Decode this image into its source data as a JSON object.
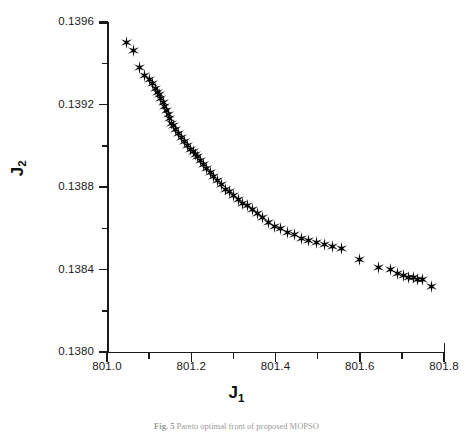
{
  "figure": {
    "caption_prefix": "Fig. 5",
    "caption_text": "Pareto optimal front of proposed MOPSO",
    "background_color": "#ffffff",
    "marker_color": "#080808",
    "axis_color": "#1a1a1a"
  },
  "chart_data": {
    "type": "scatter",
    "title": "",
    "xlabel": "J",
    "xlabel_sub": "1",
    "ylabel": "J",
    "ylabel_sub": "2",
    "xlim": [
      801.0,
      801.8
    ],
    "ylim": [
      0.138,
      0.1396
    ],
    "xticks": [
      801.0,
      801.2,
      801.4,
      801.6,
      801.8
    ],
    "xtick_labels": [
      "801.0",
      "801.2",
      "801.4",
      "801.6",
      "801.8"
    ],
    "x_minor_ticks": [
      801.1,
      801.3,
      801.5,
      801.7
    ],
    "yticks": [
      0.138,
      0.1384,
      0.1388,
      0.1392,
      0.1396
    ],
    "ytick_labels": [
      "0.1380",
      "0.1384",
      "0.1388",
      "0.1392",
      "0.1396"
    ],
    "y_minor_ticks": [
      0.1382,
      0.1386,
      0.139,
      0.1394
    ],
    "grid": false,
    "legend": false,
    "marker": "star6",
    "n_points": 62,
    "series": [
      {
        "name": "Pareto optimal front",
        "points": [
          [
            801.047,
            0.1395
          ],
          [
            801.063,
            0.13946
          ],
          [
            801.078,
            0.13938
          ],
          [
            801.09,
            0.13934
          ],
          [
            801.101,
            0.13932
          ],
          [
            801.108,
            0.1393
          ],
          [
            801.114,
            0.13928
          ],
          [
            801.119,
            0.13926
          ],
          [
            801.124,
            0.13925
          ],
          [
            801.128,
            0.13923
          ],
          [
            801.133,
            0.13921
          ],
          [
            801.137,
            0.13919
          ],
          [
            801.141,
            0.13917
          ],
          [
            801.145,
            0.13915
          ],
          [
            801.148,
            0.13913
          ],
          [
            801.152,
            0.13911
          ],
          [
            801.157,
            0.1391
          ],
          [
            801.163,
            0.13908
          ],
          [
            801.17,
            0.13906
          ],
          [
            801.177,
            0.13904
          ],
          [
            801.185,
            0.13902
          ],
          [
            801.192,
            0.139
          ],
          [
            801.199,
            0.13898
          ],
          [
            801.205,
            0.13897
          ],
          [
            801.211,
            0.13896
          ],
          [
            801.216,
            0.13895
          ],
          [
            801.222,
            0.13893
          ],
          [
            801.229,
            0.13891
          ],
          [
            801.237,
            0.13889
          ],
          [
            801.245,
            0.13887
          ],
          [
            801.254,
            0.13885
          ],
          [
            801.263,
            0.13883
          ],
          [
            801.272,
            0.13881
          ],
          [
            801.281,
            0.13879
          ],
          [
            801.29,
            0.13878
          ],
          [
            801.3,
            0.13876
          ],
          [
            801.311,
            0.13874
          ],
          [
            801.322,
            0.13872
          ],
          [
            801.333,
            0.13871
          ],
          [
            801.345,
            0.13869
          ],
          [
            801.357,
            0.13867
          ],
          [
            801.37,
            0.13865
          ],
          [
            801.383,
            0.13863
          ],
          [
            801.397,
            0.13861
          ],
          [
            801.412,
            0.1386
          ],
          [
            801.428,
            0.13858
          ],
          [
            801.444,
            0.13857
          ],
          [
            801.461,
            0.13855
          ],
          [
            801.479,
            0.13854
          ],
          [
            801.497,
            0.13853
          ],
          [
            801.516,
            0.13852
          ],
          [
            801.536,
            0.13851
          ],
          [
            801.557,
            0.1385
          ],
          [
            801.6,
            0.13845
          ],
          [
            801.645,
            0.13841
          ],
          [
            801.672,
            0.1384
          ],
          [
            801.69,
            0.13838
          ],
          [
            801.704,
            0.13837
          ],
          [
            801.716,
            0.13836
          ],
          [
            801.727,
            0.13836
          ],
          [
            801.738,
            0.13835
          ],
          [
            801.748,
            0.13835
          ],
          [
            801.77,
            0.13832
          ]
        ]
      }
    ]
  }
}
